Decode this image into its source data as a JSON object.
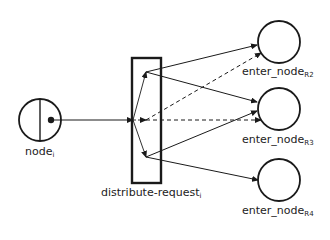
{
  "diagram": {
    "nodes": {
      "source": {
        "base": "node",
        "sub": "i"
      },
      "distributor": {
        "base": "distribute-request",
        "sub": "i"
      },
      "targets": [
        {
          "base": "enter_node",
          "sub": "R2"
        },
        {
          "base": "enter_node",
          "sub": "R3"
        },
        {
          "base": "enter_node",
          "sub": "R4"
        }
      ]
    },
    "edges": [
      {
        "from": "node_i",
        "to": "distribute-request_i",
        "style": "solid"
      },
      {
        "from": "distribute-request_i",
        "to": "enter_node_R2",
        "style": "solid"
      },
      {
        "from": "distribute-request_i",
        "to": "enter_node_R2",
        "style": "dashed"
      },
      {
        "from": "distribute-request_i",
        "to": "enter_node_R3",
        "style": "solid"
      },
      {
        "from": "distribute-request_i",
        "to": "enter_node_R3",
        "style": "solid"
      },
      {
        "from": "distribute-request_i",
        "to": "enter_node_R3",
        "style": "dashed"
      },
      {
        "from": "distribute-request_i",
        "to": "enter_node_R4",
        "style": "solid"
      }
    ],
    "colors": {
      "stroke": "#1a1a1a",
      "text": "#222222",
      "background": "#ffffff"
    }
  }
}
